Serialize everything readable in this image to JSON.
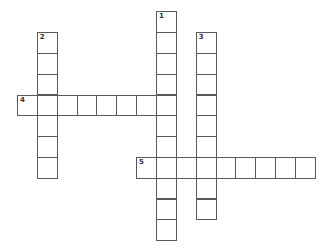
{
  "puzzle": {
    "type": "crossword",
    "cell_origin": {
      "x": 17,
      "y": 11.3
    },
    "cell_step": {
      "x": 19.85,
      "y": 20.8
    },
    "line_color": "#5a5a5a",
    "clues": [
      {
        "number": "1",
        "direction": "down",
        "col": 7,
        "row": 0,
        "length": 11
      },
      {
        "number": "2",
        "direction": "down",
        "col": 1,
        "row": 1,
        "length": 7
      },
      {
        "number": "3",
        "direction": "down",
        "col": 9,
        "row": 1,
        "length": 9
      },
      {
        "number": "4",
        "direction": "across",
        "col": 0,
        "row": 4,
        "length": 8
      },
      {
        "number": "5",
        "direction": "across",
        "col": 6,
        "row": 7,
        "length": 9
      }
    ]
  }
}
